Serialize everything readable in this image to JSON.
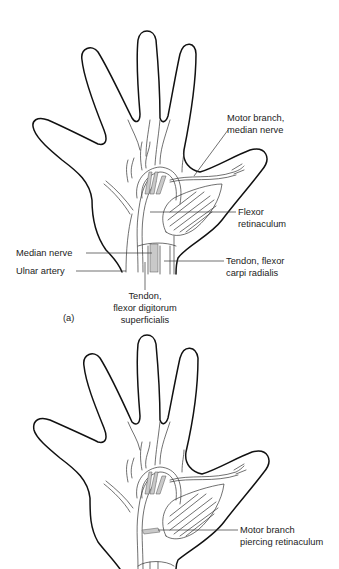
{
  "figure_a": {
    "panel_label": "(a)",
    "labels": {
      "motor_branch_line1": "Motor branch,",
      "motor_branch_line2": "median nerve",
      "flexor_retinaculum_line1": "Flexor",
      "flexor_retinaculum_line2": "retinaculum",
      "median_nerve": "Median nerve",
      "ulnar_artery": "Ulnar artery",
      "tendon_fcr_line1": "Tendon, flexor",
      "tendon_fcr_line2": "carpi radialis",
      "tendon_fds_line1": "Tendon,",
      "tendon_fds_line2": "flexor digitorum",
      "tendon_fds_line3": "superficialis"
    }
  },
  "figure_b": {
    "labels": {
      "motor_branch_piercing_line1": "Motor branch",
      "motor_branch_piercing_line2": "piercing retinaculum"
    }
  },
  "colors": {
    "outline": "#111111",
    "text": "#222222",
    "stipple": "#c9c9c9",
    "background": "#ffffff"
  }
}
